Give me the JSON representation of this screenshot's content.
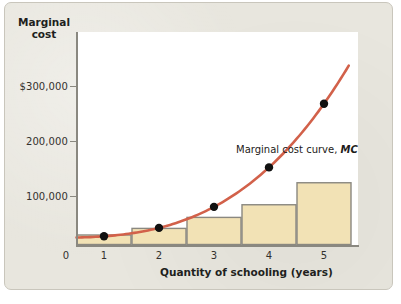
{
  "chart_data": {
    "type": "bar",
    "title": "",
    "subtitle": "",
    "xlabel": "Quantity of schooling (years)",
    "ylabel": "Marginal cost",
    "categories": [
      "1",
      "2",
      "3",
      "4",
      "5"
    ],
    "values": [
      30000,
      42000,
      62000,
      85000,
      125000
    ],
    "series": [
      {
        "name": "Marginal cost bars",
        "type": "bar",
        "values": [
          30000,
          42000,
          62000,
          85000,
          125000
        ]
      },
      {
        "name": "Marginal cost curve, MC",
        "type": "line",
        "x": [
          1,
          2,
          3,
          4,
          5
        ],
        "values": [
          30000,
          42000,
          62000,
          85000,
          125000
        ]
      }
    ],
    "points": [
      {
        "x": 1,
        "y": 30000
      },
      {
        "x": 2,
        "y": 42000
      },
      {
        "x": 3,
        "y": 62000
      },
      {
        "x": 4,
        "y": 85000
      },
      {
        "x": 5,
        "y": 125000
      }
    ],
    "xticks": [
      "0",
      "1",
      "2",
      "3",
      "4",
      "5"
    ],
    "yticks": [
      "$300,000",
      "200,000",
      "100,000"
    ],
    "ytick_values": [
      300000,
      200000,
      100000
    ],
    "ylim": [
      0,
      380000
    ],
    "xlim": [
      0,
      5.5
    ],
    "grid": false,
    "legend_position": "inside-upper-right",
    "annotations": [
      {
        "text": "Marginal cost curve, MC",
        "emphasis": "MC"
      }
    ],
    "colors": {
      "bar_fill": "#f2e2b5",
      "bar_stroke": "#8a8880",
      "curve": "#d2614a",
      "point": "#111111",
      "plot_background": "#ffffff",
      "panel_background": "#e8e6de",
      "axis": "#8a8880",
      "text": "#211f1d"
    }
  },
  "axis": {
    "y_title_line1": "Marginal",
    "y_title_line2": "cost",
    "x_title": "Quantity of schooling (years)",
    "y_ticks": [
      {
        "label": "$300,000",
        "top": 86
      },
      {
        "label": "200,000",
        "top": 141
      },
      {
        "label": "100,000",
        "top": 196
      }
    ],
    "x_ticks": [
      {
        "label": "0",
        "left": 66
      },
      {
        "label": "1",
        "left": 104
      },
      {
        "label": "2",
        "left": 159
      },
      {
        "label": "3",
        "left": 214
      },
      {
        "label": "4",
        "left": 269
      },
      {
        "label": "5",
        "left": 324
      }
    ]
  },
  "legend": {
    "text_before": "Marginal cost curve, ",
    "text_italic": "MC"
  }
}
